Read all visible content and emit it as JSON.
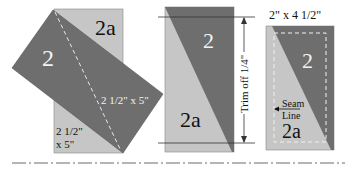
{
  "colors": {
    "dark": "#6e6e6e",
    "light": "#c6c6c6",
    "white_text": "#f2f2f2",
    "black_text": "#111111",
    "line": "#333333"
  },
  "panel1": {
    "dark_label": "2",
    "light_label": "2a",
    "dark_size": "2 1/2\" x 5\"",
    "light_size_line1": "2 1/2\"",
    "light_size_line2": "x 5\""
  },
  "panel2": {
    "dark_label": "2",
    "light_label": "2a",
    "trim_label": "Trim off 1/4\""
  },
  "panel3": {
    "size_label": "2\" x 4 1/2\"",
    "dark_label": "2",
    "light_label": "2a",
    "seam_line1": "Seam",
    "seam_line2": "Line"
  }
}
